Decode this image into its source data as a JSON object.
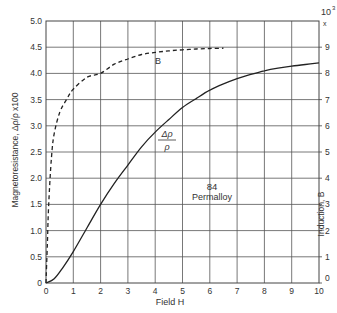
{
  "chart_data": {
    "type": "line",
    "title": "",
    "xlabel": "Field H",
    "ylabel": "Magnetoresistance, Δρ/ρ x100",
    "y2label": "Induction, B",
    "y2_multiplier": "10³ x",
    "xlim": [
      0,
      10
    ],
    "ylim": [
      0,
      5.0
    ],
    "y2lim": [
      0,
      10
    ],
    "grid": true,
    "x_ticks": [
      "0",
      "1",
      "2",
      "3",
      "4",
      "5",
      "6",
      "7",
      "8",
      "9",
      "10"
    ],
    "y_ticks": [
      "0",
      "0.5",
      "1.0",
      "1.5",
      "2.0",
      "2.5",
      "3.0",
      "3.5",
      "4.0",
      "4.5",
      "5.0"
    ],
    "y2_ticks": [
      "0",
      "1",
      "2",
      "3",
      "4",
      "5",
      "6",
      "7",
      "8",
      "9"
    ],
    "annotations": [
      "84 Permalloy",
      "B",
      "Δρ/ρ"
    ],
    "series": [
      {
        "name": "Δρ/ρ",
        "axis": "left",
        "style": "solid",
        "x": [
          0,
          0.3,
          0.6,
          1,
          1.5,
          2,
          2.5,
          3,
          3.5,
          4,
          4.5,
          5,
          5.5,
          6,
          6.5,
          7,
          7.5,
          8,
          8.5,
          9,
          9.5,
          10
        ],
        "values": [
          0,
          0.08,
          0.28,
          0.6,
          1.05,
          1.5,
          1.9,
          2.25,
          2.6,
          2.88,
          3.12,
          3.35,
          3.52,
          3.68,
          3.8,
          3.9,
          3.98,
          4.05,
          4.1,
          4.14,
          4.17,
          4.2
        ]
      },
      {
        "name": "B",
        "axis": "right",
        "style": "dashed",
        "x": [
          0,
          0.05,
          0.1,
          0.2,
          0.3,
          0.5,
          0.75,
          1,
          1.5,
          2,
          2.5,
          3,
          3.5,
          4,
          4.5,
          5,
          5.5,
          6,
          6.5
        ],
        "values": [
          0,
          1.5,
          3.0,
          4.8,
          5.7,
          6.5,
          7.0,
          7.4,
          7.85,
          8.0,
          8.35,
          8.55,
          8.72,
          8.8,
          8.86,
          8.9,
          8.93,
          8.95,
          8.96
        ]
      }
    ]
  },
  "labels": {
    "x_axis_title": "Field H",
    "y_axis_title": "Magnetoresistance, Δρ/ρ x100",
    "y2_axis_title": "Induction, B",
    "y2_multiplier_top": "10",
    "y2_multiplier_exp": "3",
    "y2_multiplier_x": "x",
    "curve_b_label": "B",
    "curve_rho_num": "Δρ",
    "curve_rho_den": "ρ",
    "material_line1": "84",
    "material_line2": "Permalloy"
  }
}
